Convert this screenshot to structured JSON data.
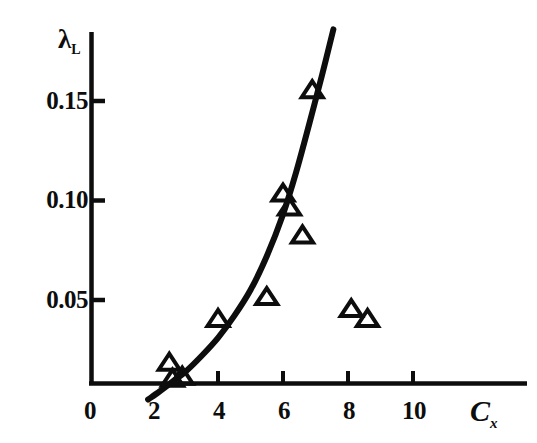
{
  "chart_data": {
    "type": "scatter",
    "title": "",
    "subtitle": "",
    "xlabel": "C",
    "xlabel_sub": "x",
    "ylabel": "λ",
    "ylabel_sub": "L",
    "xlim": [
      0,
      11.8
    ],
    "ylim": [
      0,
      0.185
    ],
    "grid": false,
    "legend": null,
    "xticks": [
      0,
      2,
      4,
      6,
      8,
      10
    ],
    "xtick_labels": [
      "0",
      "2",
      "4",
      "6",
      "8",
      "10"
    ],
    "yticks": [
      0.05,
      0.1,
      0.15
    ],
    "ytick_labels": [
      "0.05",
      "0.10",
      "0.15"
    ],
    "series": [
      {
        "name": "measurements",
        "marker": "open-triangle-up",
        "color": "#0d0d0d",
        "points": [
          {
            "x": 2.5,
            "y": 0.018
          },
          {
            "x": 2.6,
            "y": 0.01
          },
          {
            "x": 2.9,
            "y": 0.011
          },
          {
            "x": 4.0,
            "y": 0.04
          },
          {
            "x": 5.5,
            "y": 0.051
          },
          {
            "x": 6.0,
            "y": 0.103
          },
          {
            "x": 6.2,
            "y": 0.096
          },
          {
            "x": 6.6,
            "y": 0.082
          },
          {
            "x": 6.9,
            "y": 0.155
          },
          {
            "x": 8.1,
            "y": 0.045
          },
          {
            "x": 8.6,
            "y": 0.04
          }
        ]
      },
      {
        "name": "fitted-curve",
        "marker": "none",
        "style": "solid-thick",
        "color": "#0d0d0d",
        "points": [
          {
            "x": 1.85,
            "y": 0.0
          },
          {
            "x": 2.2,
            "y": 0.004
          },
          {
            "x": 2.6,
            "y": 0.009
          },
          {
            "x": 3.0,
            "y": 0.014
          },
          {
            "x": 3.5,
            "y": 0.022
          },
          {
            "x": 4.0,
            "y": 0.031
          },
          {
            "x": 4.5,
            "y": 0.042
          },
          {
            "x": 5.0,
            "y": 0.055
          },
          {
            "x": 5.5,
            "y": 0.072
          },
          {
            "x": 6.0,
            "y": 0.093
          },
          {
            "x": 6.4,
            "y": 0.114
          },
          {
            "x": 6.8,
            "y": 0.138
          },
          {
            "x": 7.2,
            "y": 0.163
          },
          {
            "x": 7.55,
            "y": 0.186
          }
        ]
      }
    ]
  },
  "axes": {
    "y_axis_name": "lambda-L-axis",
    "x_axis_name": "Cx-axis"
  }
}
